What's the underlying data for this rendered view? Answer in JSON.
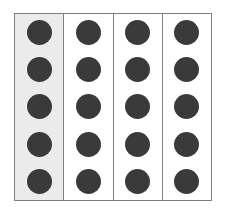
{
  "figure": {
    "columns_count": 4,
    "dots_per_column": 5,
    "dot_color": "#3a3a3a",
    "highlight_color": "#ebebeb",
    "plain_color": "#ffffff",
    "border_color": "#808080",
    "columns": [
      {
        "name": "column-1",
        "highlighted": true,
        "dot_count": 5,
        "dots": [
          "dot-1",
          "dot-2",
          "dot-3",
          "dot-4",
          "dot-5"
        ]
      },
      {
        "name": "column-2",
        "highlighted": false,
        "dot_count": 5,
        "dots": [
          "dot-1",
          "dot-2",
          "dot-3",
          "dot-4",
          "dot-5"
        ]
      },
      {
        "name": "column-3",
        "highlighted": false,
        "dot_count": 5,
        "dots": [
          "dot-1",
          "dot-2",
          "dot-3",
          "dot-4",
          "dot-5"
        ]
      },
      {
        "name": "column-4",
        "highlighted": false,
        "dot_count": 5,
        "dots": [
          "dot-1",
          "dot-2",
          "dot-3",
          "dot-4",
          "dot-5"
        ]
      }
    ]
  }
}
